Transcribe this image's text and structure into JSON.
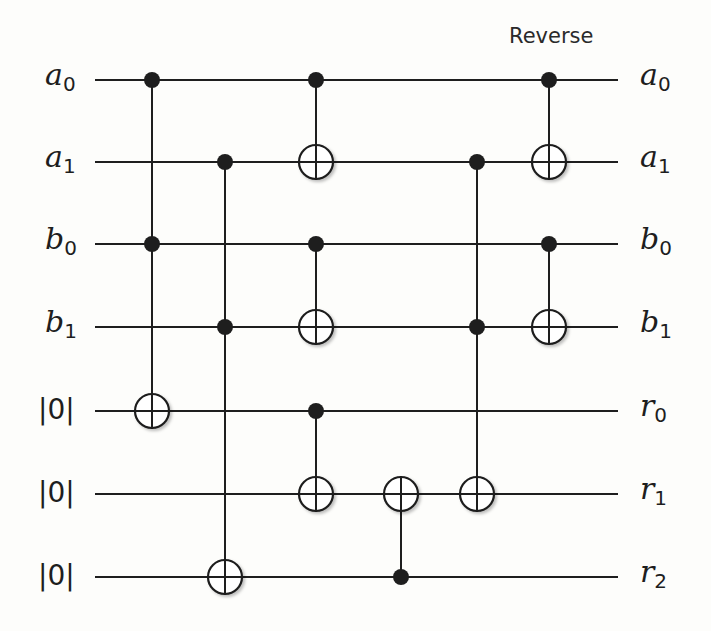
{
  "diagram": {
    "title": "Reverse",
    "left_labels": [
      {
        "sym": "a",
        "sub": "0"
      },
      {
        "sym": "a",
        "sub": "1"
      },
      {
        "sym": "b",
        "sub": "0"
      },
      {
        "sym": "b",
        "sub": "1"
      },
      {
        "ket": "|0|"
      },
      {
        "ket": "|0|"
      },
      {
        "ket": "|0|"
      }
    ],
    "right_labels": [
      {
        "sym": "a",
        "sub": "0"
      },
      {
        "sym": "a",
        "sub": "1"
      },
      {
        "sym": "b",
        "sub": "0"
      },
      {
        "sym": "b",
        "sub": "1"
      },
      {
        "sym": "r",
        "sub": "0"
      },
      {
        "sym": "r",
        "sub": "1"
      },
      {
        "sym": "r",
        "sub": "2"
      }
    ],
    "wire_y": [
      80,
      162,
      244,
      327,
      411,
      494,
      577
    ],
    "wire_x": [
      95,
      618
    ],
    "gates": [
      {
        "x": 152,
        "controls": [
          0,
          2
        ],
        "target": 4
      },
      {
        "x": 225,
        "controls": [
          1,
          3
        ],
        "target": 6
      },
      {
        "x": 316,
        "controls": [
          0
        ],
        "target": 1
      },
      {
        "x": 316,
        "controls": [
          2
        ],
        "target": 3
      },
      {
        "x": 316,
        "controls": [
          4
        ],
        "target": 5
      },
      {
        "x": 401,
        "controls": [
          6
        ],
        "target": 5
      },
      {
        "x": 477,
        "controls": [
          1,
          3
        ],
        "target": 5
      },
      {
        "x": 549,
        "controls": [
          0
        ],
        "target": 1
      },
      {
        "x": 549,
        "controls": [
          2
        ],
        "target": 3
      }
    ],
    "colors": {
      "line": "#1e1e1e",
      "background": "#fdfdfb"
    }
  }
}
